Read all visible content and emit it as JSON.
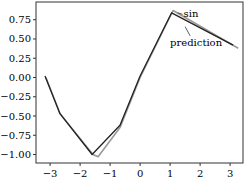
{
  "chart_data": {
    "type": "line",
    "title": "",
    "xlabel": "",
    "ylabel": "",
    "xlim": [
      -3.47,
      3.43
    ],
    "ylim": [
      -1.11,
      0.98
    ],
    "grid": false,
    "legend": null,
    "xticks": [
      -3,
      -2,
      -1,
      0,
      1,
      2,
      3
    ],
    "xtick_labels": [
      "−3",
      "−2",
      "−1",
      "0",
      "1",
      "2",
      "3"
    ],
    "yticks": [
      0.75,
      0.5,
      0.25,
      0.0,
      -0.25,
      -0.5,
      -0.75,
      -1.0
    ],
    "ytick_labels": [
      "0.75",
      "0.50",
      "0.25",
      "0.00",
      "−0.25",
      "−0.50",
      "−0.75",
      "−1.00"
    ],
    "series": [
      {
        "name": "sin",
        "color": "#999999",
        "x": [
          -3.14,
          -2.67,
          -1.57,
          -1.4,
          -0.67,
          0.0,
          1.1,
          3.27
        ],
        "y": [
          0.0,
          -0.47,
          -1.0,
          -1.03,
          -0.65,
          0.0,
          0.87,
          0.38
        ]
      },
      {
        "name": "prediction",
        "color": "#222222",
        "x": [
          -3.17,
          -2.67,
          -1.6,
          -0.67,
          0.0,
          1.05,
          3.1
        ],
        "y": [
          0.02,
          -0.47,
          -1.0,
          -0.62,
          0.02,
          0.84,
          0.42
        ]
      }
    ],
    "annotations": [
      {
        "text": "sin",
        "x": 1.45,
        "y": 0.82,
        "arrow_to": [
          1.25,
          0.84
        ]
      },
      {
        "text": "prediction",
        "x": 1.0,
        "y": 0.45,
        "arrow_to": [
          1.5,
          0.66
        ]
      }
    ]
  }
}
